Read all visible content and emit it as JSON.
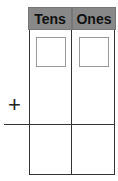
{
  "place_value_chart": {
    "columns": [
      {
        "label": "Tens"
      },
      {
        "label": "Ones"
      }
    ],
    "operator": "+"
  }
}
